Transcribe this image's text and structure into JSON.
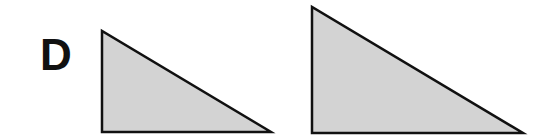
{
  "figure": {
    "panel_label": "D",
    "colors": {
      "fill": "#d3d3d3",
      "stroke": "#111111",
      "background": "#ffffff"
    },
    "shapes": [
      {
        "name": "small-right-triangle",
        "type": "right-triangle",
        "points": "102,31 102,132 271,132"
      },
      {
        "name": "large-right-triangle",
        "type": "right-triangle",
        "points": "312,7 312,133 523,133"
      }
    ]
  }
}
